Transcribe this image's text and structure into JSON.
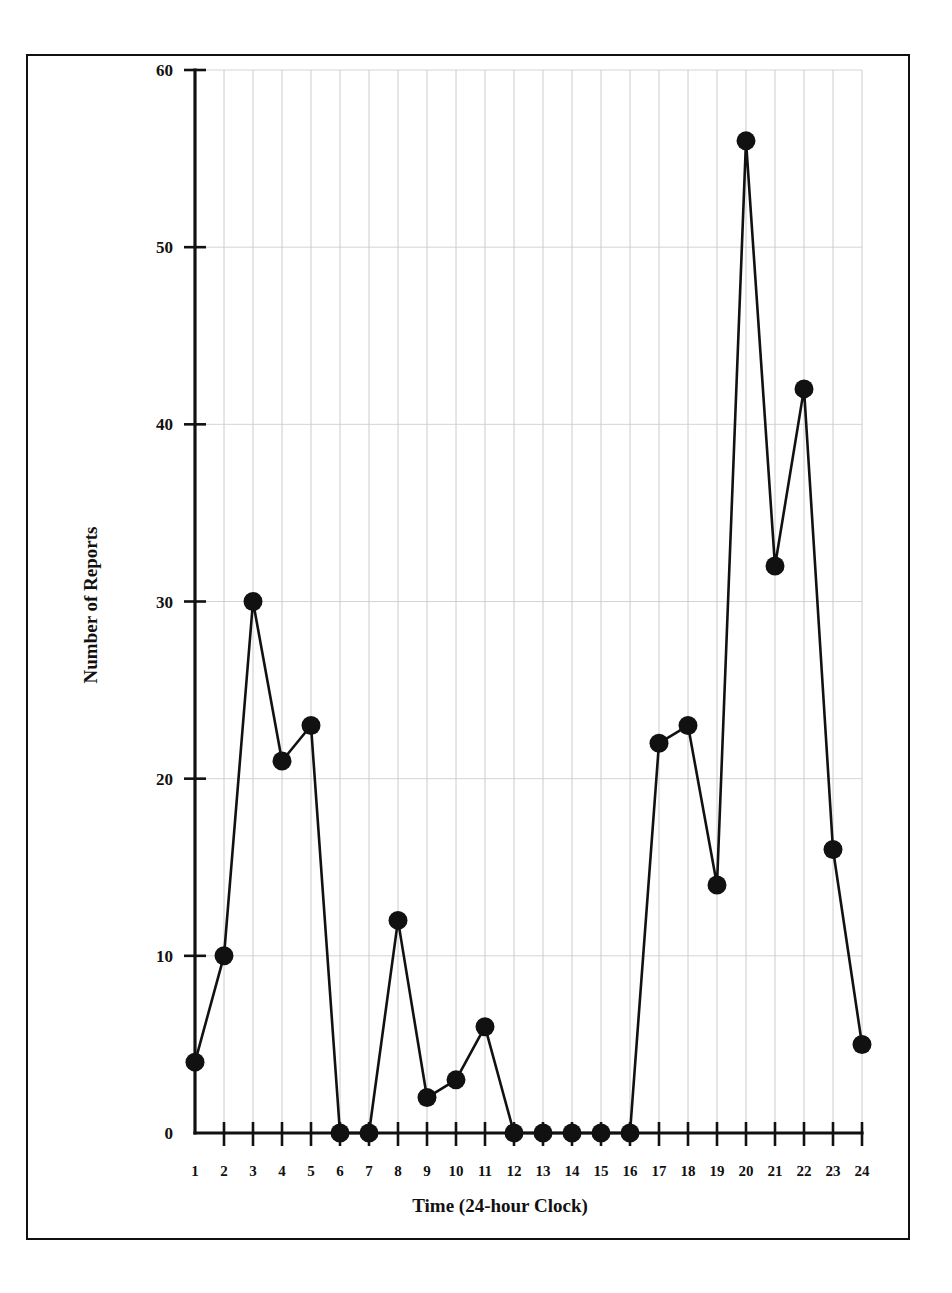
{
  "chart_data": {
    "type": "line",
    "title": "",
    "subtitle": "",
    "xlabel": "Time (24-hour Clock)",
    "ylabel": "Number of Reports",
    "categories": [
      "1",
      "2",
      "3",
      "4",
      "5",
      "6",
      "7",
      "8",
      "9",
      "10",
      "11",
      "12",
      "13",
      "14",
      "15",
      "16",
      "17",
      "18",
      "19",
      "20",
      "21",
      "22",
      "23",
      "24"
    ],
    "x": [
      1,
      2,
      3,
      4,
      5,
      6,
      7,
      8,
      9,
      10,
      11,
      12,
      13,
      14,
      15,
      16,
      17,
      18,
      19,
      20,
      21,
      22,
      23,
      24
    ],
    "values": [
      4,
      10,
      30,
      21,
      23,
      0,
      0,
      12,
      2,
      3,
      6,
      0,
      0,
      0,
      0,
      0,
      22,
      23,
      14,
      56,
      32,
      42,
      16,
      5
    ],
    "series": [
      {
        "name": "Number of Reports",
        "values": [
          4,
          10,
          30,
          21,
          23,
          0,
          0,
          12,
          2,
          3,
          6,
          0,
          0,
          0,
          0,
          0,
          22,
          23,
          14,
          56,
          32,
          42,
          16,
          5
        ]
      }
    ],
    "xlim": [
      1,
      24
    ],
    "ylim": [
      0,
      60
    ],
    "ytick_labels": [
      "0",
      "10",
      "20",
      "30",
      "40",
      "50",
      "60"
    ],
    "yticks": [
      0,
      10,
      20,
      30,
      40,
      50,
      60
    ],
    "xtick_labels": [
      "1",
      "2",
      "3",
      "4",
      "5",
      "6",
      "7",
      "8",
      "9",
      "10",
      "11",
      "12",
      "13",
      "14",
      "15",
      "16",
      "17",
      "18",
      "19",
      "20",
      "21",
      "22",
      "23",
      "24"
    ],
    "grid": true,
    "grid_vertical": true,
    "grid_horizontal": true,
    "legend": false,
    "legend_position": "none",
    "marker": "filled-circle",
    "marker_color": "#111111",
    "line_color": "#111111",
    "background_color": "#ffffff",
    "frame": true,
    "annotations": []
  },
  "figure": {
    "border_color": "#111111",
    "page_background": "#ffffff"
  }
}
